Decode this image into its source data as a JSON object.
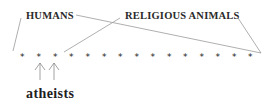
{
  "diagram": {
    "labels": {
      "humans": "HUMANS",
      "religious_animals": "RELIGIOUS ANIMALS",
      "atheists": "atheists"
    },
    "stars": {
      "count": 15,
      "glyph": "*",
      "items": [
        "*",
        "*",
        "*",
        "*",
        "*",
        "*",
        "*",
        "*",
        "*",
        "*",
        "*",
        "*",
        "*",
        "*",
        "*"
      ]
    },
    "groups": [
      {
        "name": "HUMANS",
        "spans_stars": "1-15"
      },
      {
        "name": "RELIGIOUS ANIMALS",
        "spans_stars": "3-15"
      },
      {
        "name": "atheists",
        "points_to_stars": [
          2,
          3
        ]
      }
    ],
    "colors": {
      "text": "#2a2a2a",
      "lines": "#9a9a9a",
      "background": "#ffffff"
    }
  }
}
